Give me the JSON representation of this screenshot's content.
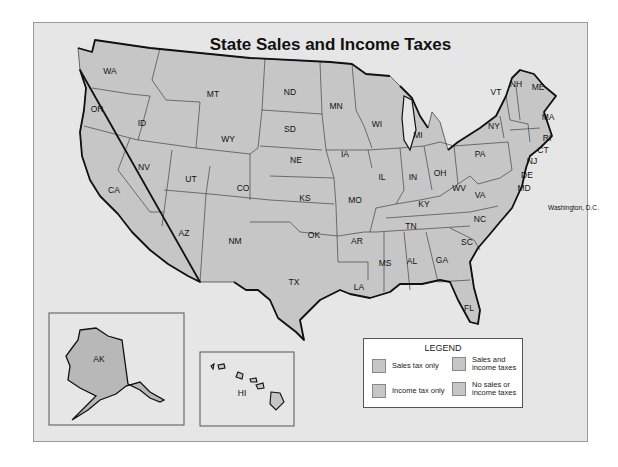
{
  "title": "State Sales and Income Taxes",
  "map": {
    "states": [
      {
        "abbr": "WA",
        "x": 110,
        "y": 74
      },
      {
        "abbr": "OR",
        "x": 97,
        "y": 112
      },
      {
        "abbr": "CA",
        "x": 114,
        "y": 193
      },
      {
        "abbr": "ID",
        "x": 142,
        "y": 126
      },
      {
        "abbr": "NV",
        "x": 144,
        "y": 170
      },
      {
        "abbr": "MT",
        "x": 213,
        "y": 97
      },
      {
        "abbr": "WY",
        "x": 228,
        "y": 142
      },
      {
        "abbr": "UT",
        "x": 191,
        "y": 182
      },
      {
        "abbr": "CO",
        "x": 243,
        "y": 191
      },
      {
        "abbr": "AZ",
        "x": 184,
        "y": 236
      },
      {
        "abbr": "NM",
        "x": 235,
        "y": 244
      },
      {
        "abbr": "ND",
        "x": 290,
        "y": 95
      },
      {
        "abbr": "SD",
        "x": 290,
        "y": 132
      },
      {
        "abbr": "NE",
        "x": 296,
        "y": 163
      },
      {
        "abbr": "KS",
        "x": 305,
        "y": 201
      },
      {
        "abbr": "OK",
        "x": 314,
        "y": 238
      },
      {
        "abbr": "TX",
        "x": 294,
        "y": 285
      },
      {
        "abbr": "MN",
        "x": 336,
        "y": 109
      },
      {
        "abbr": "IA",
        "x": 345,
        "y": 157
      },
      {
        "abbr": "MO",
        "x": 355,
        "y": 203
      },
      {
        "abbr": "AR",
        "x": 357,
        "y": 244
      },
      {
        "abbr": "LA",
        "x": 359,
        "y": 290
      },
      {
        "abbr": "WI",
        "x": 377,
        "y": 127
      },
      {
        "abbr": "IL",
        "x": 382,
        "y": 180
      },
      {
        "abbr": "MI",
        "x": 418,
        "y": 138
      },
      {
        "abbr": "IN",
        "x": 413,
        "y": 180
      },
      {
        "abbr": "OH",
        "x": 440,
        "y": 176
      },
      {
        "abbr": "KY",
        "x": 424,
        "y": 207
      },
      {
        "abbr": "TN",
        "x": 411,
        "y": 229
      },
      {
        "abbr": "MS",
        "x": 385,
        "y": 266
      },
      {
        "abbr": "AL",
        "x": 412,
        "y": 264
      },
      {
        "abbr": "GA",
        "x": 442,
        "y": 263
      },
      {
        "abbr": "FL",
        "x": 469,
        "y": 311
      },
      {
        "abbr": "SC",
        "x": 467,
        "y": 245
      },
      {
        "abbr": "NC",
        "x": 480,
        "y": 222
      },
      {
        "abbr": "VA",
        "x": 480,
        "y": 198
      },
      {
        "abbr": "WV",
        "x": 459,
        "y": 191
      },
      {
        "abbr": "PA",
        "x": 480,
        "y": 157
      },
      {
        "abbr": "NY",
        "x": 494,
        "y": 129
      },
      {
        "abbr": "VT",
        "x": 496,
        "y": 95
      },
      {
        "abbr": "NH",
        "x": 516,
        "y": 87
      },
      {
        "abbr": "ME",
        "x": 538,
        "y": 90
      },
      {
        "abbr": "MA",
        "x": 548,
        "y": 120
      },
      {
        "abbr": "RI",
        "x": 547,
        "y": 141
      },
      {
        "abbr": "CT",
        "x": 543,
        "y": 153
      },
      {
        "abbr": "NJ",
        "x": 532,
        "y": 164
      },
      {
        "abbr": "DE",
        "x": 527,
        "y": 178
      },
      {
        "abbr": "MD",
        "x": 524,
        "y": 191
      },
      {
        "abbr": "Washington, D.C.",
        "x": 548,
        "y": 210
      },
      {
        "abbr": "AK",
        "x": 99,
        "y": 362
      },
      {
        "abbr": "HI",
        "x": 242,
        "y": 396
      }
    ]
  },
  "legend": {
    "title": "LEGEND",
    "items": [
      {
        "label_1": "Sales tax only",
        "label_2": ""
      },
      {
        "label_1": "Sales and",
        "label_2": "income taxes"
      },
      {
        "label_1": "Income tax only",
        "label_2": ""
      },
      {
        "label_1": "No sales or",
        "label_2": "income taxes"
      }
    ]
  },
  "colors": {
    "background": "#e6e6e6",
    "state_fill": "#c6c6c6",
    "alaska_fill": "#b8b8b8",
    "border": "#333333"
  }
}
